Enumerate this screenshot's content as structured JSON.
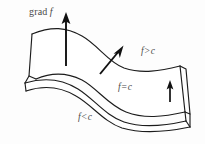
{
  "figure": {
    "background_color": "#fdfdfd",
    "ink_color": "#1c1c1c",
    "label_color": "#4a4a4a",
    "width": 205,
    "height": 144
  },
  "labels": {
    "gradient": {
      "text_prefix": "grad",
      "text_variable": "f",
      "full_text": "grad f"
    },
    "upper_region": {
      "variable": "f",
      "operator": ">",
      "constant": "c",
      "full_text": "f > c"
    },
    "level_surface": {
      "variable": "f",
      "operator": "=",
      "constant": "c",
      "full_text": "f = c"
    },
    "lower_region": {
      "variable": "f",
      "operator": "<",
      "constant": "c",
      "full_text": "f < c"
    }
  },
  "arrows": {
    "gradient_main": {
      "name": "grad f",
      "direction": "up",
      "x": 66,
      "y_tail": 66,
      "y_tip": 16
    },
    "gradient_normal": {
      "name": "normal to level surface",
      "direction": "up-right",
      "x_tail": 101,
      "y_tail": 73,
      "x_tip": 122,
      "y_tip": 48
    },
    "gradient_right": {
      "name": "upward normal at right",
      "direction": "up",
      "x": 170,
      "y_tail": 101,
      "y_tip": 81
    }
  },
  "sheets": [
    {
      "name": "upper-sheet",
      "region_label": "f > c"
    },
    {
      "name": "middle-sheet",
      "region_label": "f = c"
    },
    {
      "name": "lower-sheet",
      "region_label": "f < c"
    }
  ]
}
